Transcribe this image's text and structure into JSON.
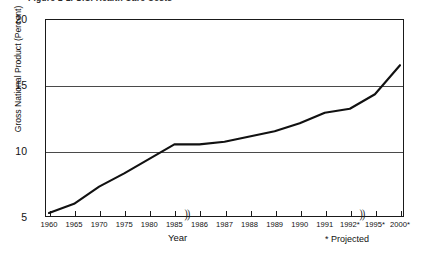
{
  "figure": {
    "caption": "Figure 1-1.   U.S. Health Care Costs"
  },
  "footnote": "* Projected",
  "chart_data": {
    "type": "line",
    "title": "",
    "xlabel": "Year",
    "ylabel": "Gross National Product (Percent)",
    "ylim": [
      5,
      20
    ],
    "yticks": [
      5,
      10,
      15,
      20
    ],
    "ytick_labels": [
      "5",
      "10",
      "15",
      "20"
    ],
    "grid": true,
    "grid_axis": "y",
    "legend": false,
    "axis_breaks": [
      {
        "after_category": "1985"
      },
      {
        "after_category": "1992*"
      }
    ],
    "categories": [
      "1960",
      "1965",
      "1970",
      "1975",
      "1980",
      "1985",
      "1986",
      "1987",
      "1988",
      "1989",
      "1990",
      "1991",
      "1992*",
      "1995*",
      "2000*"
    ],
    "values": [
      5.3,
      6.0,
      7.3,
      8.3,
      9.4,
      10.5,
      10.5,
      10.7,
      11.1,
      11.5,
      12.1,
      12.9,
      13.2,
      14.3,
      16.5
    ],
    "series": [
      {
        "name": "Health care costs as percent of GNP",
        "color": "#111111",
        "values": [
          5.3,
          6.0,
          7.3,
          8.3,
          9.4,
          10.5,
          10.5,
          10.7,
          11.1,
          11.5,
          12.1,
          12.9,
          13.2,
          14.3,
          16.5
        ]
      }
    ]
  }
}
